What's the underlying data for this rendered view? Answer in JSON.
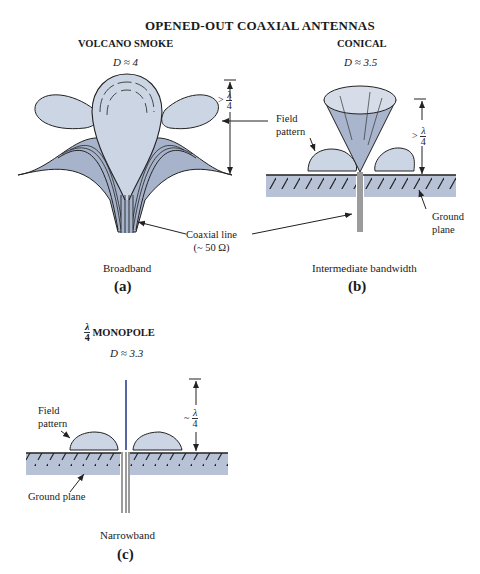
{
  "title": "OPENED-OUT COAXIAL ANTENNAS",
  "panels": [
    {
      "id": "a",
      "name": "VOLCANO SMOKE",
      "directivity": "D ≈ 4",
      "bandwidth": "Broadband",
      "label": "(a)",
      "height_label": {
        "prefix": ">",
        "num": "λ",
        "den": "4"
      }
    },
    {
      "id": "b",
      "name": "CONICAL",
      "directivity": "D ≈ 3.5",
      "bandwidth": "Intermediate bandwidth",
      "label": "(b)",
      "height_label": {
        "prefix": ">",
        "num": "λ",
        "den": "4"
      }
    },
    {
      "id": "c",
      "name_frac": {
        "num": "λ",
        "den": "4"
      },
      "name": "MONOPOLE",
      "directivity": "D ≈ 3.3",
      "bandwidth": "Narrowband",
      "label": "(c)",
      "height_label": {
        "prefix": "~",
        "num": "λ",
        "den": "4"
      }
    }
  ],
  "annotations": {
    "field_pattern_line1": "Field",
    "field_pattern_line2": "pattern",
    "coaxial_line": "Coaxial line",
    "coaxial_impedance": "(~ 50 Ω)",
    "ground_plane_line1": "Ground",
    "ground_plane_line2": "plane",
    "ground_plane": "Ground plane"
  },
  "colors": {
    "fill_light": "#c9d3e3",
    "fill_mid": "#a9b5cc",
    "ground": "#b7c2d6",
    "stroke": "#2a2a2a",
    "monopole": "#2d3f8f"
  }
}
